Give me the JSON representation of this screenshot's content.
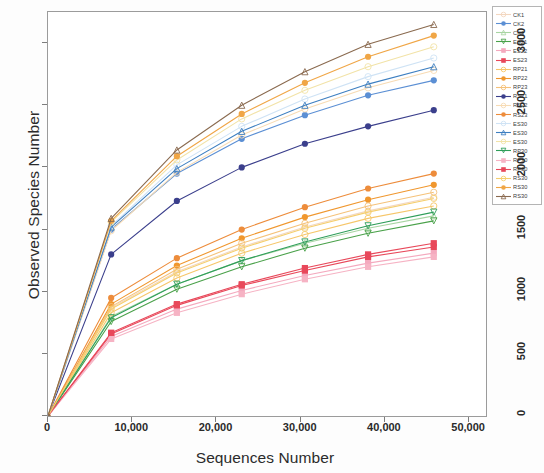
{
  "chart_data": {
    "type": "line",
    "title": "",
    "xlabel": "Sequences Number",
    "ylabel": "Observed Species Number",
    "xlim": [
      0,
      52000
    ],
    "ylim": [
      0,
      3250
    ],
    "xticks": [
      "0",
      "10,000",
      "20,000",
      "30,000",
      "40,000",
      "50,000"
    ],
    "xtick_values": [
      0,
      10000,
      20000,
      30000,
      40000,
      50000
    ],
    "yticks": [
      "0",
      "500",
      "1000",
      "1500",
      "2000",
      "2500",
      "3000"
    ],
    "ytick_values": [
      0,
      500,
      1000,
      1500,
      2000,
      2500,
      3000
    ],
    "grid": false,
    "legend_position": "right",
    "x": [
      0,
      7500,
      15300,
      23000,
      30500,
      38000,
      45800
    ],
    "series": [
      {
        "name": "CK1",
        "color": "#f3d7c0",
        "marker": "circle-open",
        "values": [
          0,
          870,
          1160,
          1360,
          1520,
          1650,
          1760
        ]
      },
      {
        "name": "CK2",
        "color": "#5b8fd4",
        "marker": "circle-filled",
        "values": [
          0,
          1500,
          1950,
          2230,
          2420,
          2580,
          2700
        ]
      },
      {
        "name": "CK3",
        "color": "#a8d5a2",
        "marker": "triangle-open",
        "values": [
          0,
          800,
          1060,
          1250,
          1390,
          1510,
          1610
        ]
      },
      {
        "name": "ES21",
        "color": "#4aa14a",
        "marker": "triangle-down",
        "values": [
          0,
          760,
          1020,
          1200,
          1350,
          1470,
          1570
        ]
      },
      {
        "name": "ES22",
        "color": "#f4a9be",
        "marker": "square-filled",
        "values": [
          0,
          640,
          860,
          1010,
          1130,
          1230,
          1310
        ]
      },
      {
        "name": "ES23",
        "color": "#e8485a",
        "marker": "square-filled",
        "values": [
          0,
          660,
          890,
          1050,
          1170,
          1280,
          1360
        ]
      },
      {
        "name": "RP21",
        "color": "#f6c66a",
        "marker": "circle-open",
        "values": [
          0,
          830,
          1110,
          1310,
          1460,
          1590,
          1690
        ]
      },
      {
        "name": "RP22",
        "color": "#f0972e",
        "marker": "circle-filled",
        "values": [
          0,
          900,
          1210,
          1430,
          1600,
          1740,
          1860
        ]
      },
      {
        "name": "RP23",
        "color": "#f5c27a",
        "marker": "circle-open",
        "values": [
          0,
          880,
          1180,
          1390,
          1550,
          1690,
          1800
        ]
      },
      {
        "name": "RS21",
        "color": "#3b3f8c",
        "marker": "circle-filled",
        "values": [
          0,
          1300,
          1730,
          2000,
          2190,
          2330,
          2460
        ]
      },
      {
        "name": "RS22",
        "color": "#f7dbb4",
        "marker": "circle-open",
        "values": [
          0,
          1490,
          1960,
          2260,
          2470,
          2640,
          2780
        ]
      },
      {
        "name": "RS23",
        "color": "#ed8c3b",
        "marker": "circle-filled",
        "values": [
          0,
          950,
          1270,
          1500,
          1680,
          1830,
          1950
        ]
      },
      {
        "name": "ES30",
        "color": "#cfe3f5",
        "marker": "circle-open",
        "values": [
          0,
          1530,
          2020,
          2330,
          2550,
          2730,
          2880
        ]
      },
      {
        "name": "ES301",
        "color": "#3d7fc1",
        "marker": "triangle-open",
        "values": [
          0,
          1520,
          1990,
          2290,
          2500,
          2670,
          2810
        ]
      },
      {
        "name": "ES302",
        "color": "#f2e3a8",
        "marker": "circle-open",
        "values": [
          0,
          1560,
          2060,
          2390,
          2620,
          2810,
          2970
        ]
      },
      {
        "name": "RP30",
        "color": "#2f9e5a",
        "marker": "triangle-down",
        "values": [
          0,
          790,
          1060,
          1250,
          1400,
          1530,
          1640
        ]
      },
      {
        "name": "RP301",
        "color": "#f6b3c4",
        "marker": "square-filled",
        "values": [
          0,
          620,
          830,
          980,
          1100,
          1200,
          1280
        ]
      },
      {
        "name": "RP302",
        "color": "#e8485a",
        "marker": "square-filled",
        "values": [
          0,
          670,
          900,
          1060,
          1190,
          1300,
          1390
        ]
      },
      {
        "name": "RS30",
        "color": "#f5cf6e",
        "marker": "circle-open",
        "values": [
          0,
          860,
          1150,
          1350,
          1510,
          1640,
          1750
        ]
      },
      {
        "name": "RS301",
        "color": "#f0a646",
        "marker": "circle-filled",
        "values": [
          0,
          1570,
          2090,
          2430,
          2680,
          2890,
          3060
        ]
      },
      {
        "name": "RS302",
        "color": "#8a6a4f",
        "marker": "triangle-open",
        "values": [
          0,
          1590,
          2140,
          2500,
          2770,
          2990,
          3150
        ]
      }
    ],
    "legend_entries": [
      {
        "label": "CK1",
        "color": "#f3d7c0",
        "marker": "circle-open"
      },
      {
        "label": "CK2",
        "color": "#5b8fd4",
        "marker": "circle-filled"
      },
      {
        "label": "CK3",
        "color": "#a8d5a2",
        "marker": "triangle-open"
      },
      {
        "label": "ES21",
        "color": "#4aa14a",
        "marker": "triangle-down"
      },
      {
        "label": "ES22",
        "color": "#f4a9be",
        "marker": "square-filled"
      },
      {
        "label": "ES23",
        "color": "#e8485a",
        "marker": "square-filled"
      },
      {
        "label": "RP21",
        "color": "#f6c66a",
        "marker": "circle-open"
      },
      {
        "label": "RP22",
        "color": "#f0972e",
        "marker": "circle-filled"
      },
      {
        "label": "RP23",
        "color": "#f5c27a",
        "marker": "circle-open"
      },
      {
        "label": "RS21",
        "color": "#3b3f8c",
        "marker": "circle-filled"
      },
      {
        "label": "RS22",
        "color": "#f7dbb4",
        "marker": "circle-open"
      },
      {
        "label": "RS23",
        "color": "#ed8c3b",
        "marker": "circle-filled"
      },
      {
        "label": "ES30",
        "color": "#cfe3f5",
        "marker": "circle-open"
      },
      {
        "label": "ES30",
        "color": "#3d7fc1",
        "marker": "triangle-open"
      },
      {
        "label": "ES30",
        "color": "#f2e3a8",
        "marker": "circle-open"
      },
      {
        "label": "RP30",
        "color": "#2f9e5a",
        "marker": "triangle-down"
      },
      {
        "label": "RP30",
        "color": "#f6b3c4",
        "marker": "square-filled"
      },
      {
        "label": "RP30",
        "color": "#e8485a",
        "marker": "square-filled"
      },
      {
        "label": "RS30",
        "color": "#f5cf6e",
        "marker": "circle-open"
      },
      {
        "label": "RS30",
        "color": "#f0a646",
        "marker": "circle-filled"
      },
      {
        "label": "RS30",
        "color": "#8a6a4f",
        "marker": "triangle-open"
      }
    ]
  }
}
